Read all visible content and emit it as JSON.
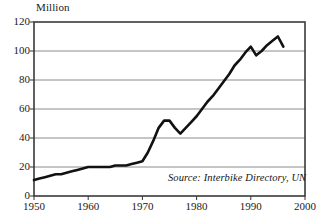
{
  "chart_data": {
    "type": "line",
    "title": "",
    "subtitle": "",
    "ylabel": "Million",
    "xlabel": "",
    "xlim": [
      1950,
      2000
    ],
    "ylim": [
      0,
      120
    ],
    "grid": true,
    "legend": false,
    "annotation": "Source: Interbike Directory, UN",
    "yticks": [
      0,
      20,
      40,
      60,
      80,
      100,
      120
    ],
    "ytick_labels": [
      "0",
      "20",
      "40",
      "60",
      "80",
      "100",
      "120"
    ],
    "xticks": [
      1950,
      1960,
      1970,
      1980,
      1990,
      2000
    ],
    "xtick_labels": [
      "1950",
      "1960",
      "1970",
      "1980",
      "1990",
      "2000"
    ],
    "series": [
      {
        "name": "World bicycle production",
        "x": [
          1950,
          1951,
          1952,
          1953,
          1954,
          1955,
          1956,
          1957,
          1958,
          1959,
          1960,
          1961,
          1962,
          1963,
          1964,
          1965,
          1966,
          1967,
          1968,
          1969,
          1970,
          1971,
          1972,
          1973,
          1974,
          1975,
          1976,
          1977,
          1978,
          1979,
          1980,
          1981,
          1982,
          1983,
          1984,
          1985,
          1986,
          1987,
          1988,
          1989,
          1990,
          1991,
          1992,
          1993,
          1994,
          1995,
          1996
        ],
        "values": [
          11,
          12,
          13,
          14,
          15,
          15,
          16,
          17,
          18,
          19,
          20,
          20,
          20,
          20,
          20,
          21,
          21,
          21,
          22,
          23,
          24,
          30,
          38,
          47,
          52,
          52,
          47,
          43,
          47,
          51,
          55,
          60,
          65,
          69,
          74,
          79,
          84,
          90,
          94,
          99,
          103,
          97,
          100,
          104,
          107,
          110,
          103
        ],
        "color": "#111111"
      }
    ]
  },
  "icons": {
    "chart": "line-chart-icon"
  }
}
